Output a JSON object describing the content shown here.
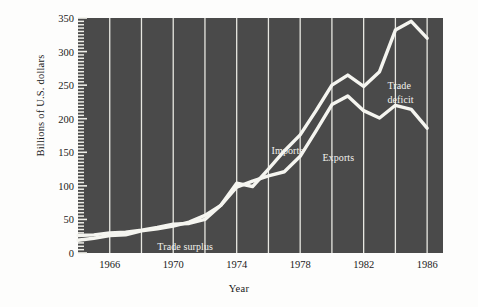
{
  "chart_data": {
    "type": "line",
    "title": "",
    "xlabel": "Year",
    "ylabel": "Billions of U.S. dollars",
    "xlim": [
      1964,
      1987
    ],
    "ylim": [
      0,
      350
    ],
    "grid": true,
    "grid_orientation": "vertical",
    "legend_position": "inline-annotations",
    "plot_background": "#4a4a4a",
    "line_color": "#f5f5f0",
    "x": [
      1964,
      1965,
      1966,
      1967,
      1968,
      1969,
      1970,
      1971,
      1972,
      1973,
      1974,
      1975,
      1976,
      1977,
      1978,
      1979,
      1980,
      1981,
      1982,
      1983,
      1984,
      1985,
      1986
    ],
    "series": [
      {
        "name": "Imports",
        "values": [
          19,
          22,
          26,
          27,
          33,
          36,
          40,
          46,
          56,
          71,
          104,
          99,
          125,
          152,
          176,
          212,
          250,
          265,
          248,
          270,
          332,
          345,
          320
        ]
      },
      {
        "name": "Exports",
        "values": [
          26,
          27,
          30,
          31,
          34,
          38,
          43,
          44,
          50,
          71,
          98,
          107,
          115,
          121,
          144,
          182,
          221,
          234,
          212,
          201,
          220,
          214,
          186
        ]
      }
    ],
    "xticks": [
      1966,
      1970,
      1974,
      1978,
      1982,
      1986
    ],
    "xtick_labels": [
      "1966",
      "1970",
      "1974",
      "1978",
      "1982",
      "1986"
    ],
    "yticks": [
      0,
      50,
      100,
      150,
      200,
      250,
      300,
      350
    ],
    "ytick_labels": [
      "0",
      "50",
      "100",
      "150",
      "200",
      "250",
      "300",
      "350"
    ],
    "gridline_years": [
      1966,
      1968,
      1970,
      1972,
      1974,
      1976,
      1978,
      1980,
      1982,
      1984,
      1986
    ],
    "annotations": [
      {
        "name": "imports-label",
        "text": "Imports",
        "year": 1976.2,
        "value": 152
      },
      {
        "name": "exports-label",
        "text": "Exports",
        "year": 1979.4,
        "value": 142
      },
      {
        "name": "trade-surplus-label",
        "text": "Trade surplus",
        "year": 1969.0,
        "value": 9
      },
      {
        "name": "trade-deficit-label-line1",
        "text": "Trade",
        "year": 1983.5,
        "value": 248
      },
      {
        "name": "trade-deficit-label-line2",
        "text": "deficit",
        "year": 1983.5,
        "value": 228
      }
    ]
  }
}
